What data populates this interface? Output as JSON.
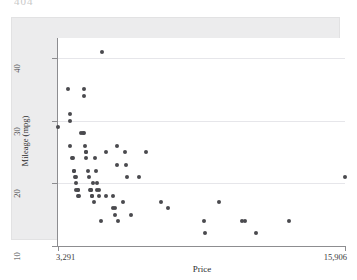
{
  "page": {
    "fragment_text": "404"
  },
  "chart_data": {
    "type": "scatter",
    "title": "",
    "xlabel": "Price",
    "ylabel": "Mileage (mpg)",
    "xlim": [
      3291,
      15906
    ],
    "ylim": [
      10,
      42
    ],
    "x_tick_labels": [
      "3,291",
      "15,906"
    ],
    "x_tick_values": [
      3291,
      15906
    ],
    "y_tick_labels": [
      "10",
      "20",
      "30",
      "40"
    ],
    "y_tick_values": [
      10,
      20,
      30,
      40
    ],
    "grid": true,
    "grid_axis": "y",
    "legend": null,
    "marker_color": "#4a4a4e",
    "marker_shape": "circle",
    "background_color": "#ececed",
    "plot_background_color": "#ffffff",
    "points": [
      {
        "x": 3291,
        "y": 29
      },
      {
        "x": 3748,
        "y": 35
      },
      {
        "x": 3798,
        "y": 31
      },
      {
        "x": 3799,
        "y": 30
      },
      {
        "x": 3829,
        "y": 26
      },
      {
        "x": 3895,
        "y": 24
      },
      {
        "x": 3955,
        "y": 24
      },
      {
        "x": 3984,
        "y": 22
      },
      {
        "x": 4010,
        "y": 22
      },
      {
        "x": 4060,
        "y": 21
      },
      {
        "x": 4082,
        "y": 21
      },
      {
        "x": 4099,
        "y": 20
      },
      {
        "x": 4100,
        "y": 19
      },
      {
        "x": 4172,
        "y": 19
      },
      {
        "x": 4181,
        "y": 19
      },
      {
        "x": 4187,
        "y": 18
      },
      {
        "x": 4195,
        "y": 18
      },
      {
        "x": 4296,
        "y": 28
      },
      {
        "x": 4389,
        "y": 28
      },
      {
        "x": 4424,
        "y": 28
      },
      {
        "x": 4425,
        "y": 34
      },
      {
        "x": 4453,
        "y": 35
      },
      {
        "x": 4482,
        "y": 26
      },
      {
        "x": 4504,
        "y": 25
      },
      {
        "x": 4516,
        "y": 25
      },
      {
        "x": 4535,
        "y": 24
      },
      {
        "x": 4589,
        "y": 22
      },
      {
        "x": 4647,
        "y": 21
      },
      {
        "x": 4697,
        "y": 19
      },
      {
        "x": 4733,
        "y": 19
      },
      {
        "x": 4749,
        "y": 19
      },
      {
        "x": 4765,
        "y": 18
      },
      {
        "x": 4782,
        "y": 18
      },
      {
        "x": 4816,
        "y": 20
      },
      {
        "x": 4890,
        "y": 17
      },
      {
        "x": 4934,
        "y": 24
      },
      {
        "x": 4941,
        "y": 22
      },
      {
        "x": 4995,
        "y": 20
      },
      {
        "x": 5005,
        "y": 19
      },
      {
        "x": 5079,
        "y": 19
      },
      {
        "x": 5104,
        "y": 18
      },
      {
        "x": 5189,
        "y": 14
      },
      {
        "x": 5222,
        "y": 41
      },
      {
        "x": 5379,
        "y": 25
      },
      {
        "x": 5397,
        "y": 18
      },
      {
        "x": 5705,
        "y": 18
      },
      {
        "x": 5719,
        "y": 16
      },
      {
        "x": 5788,
        "y": 16
      },
      {
        "x": 5799,
        "y": 15
      },
      {
        "x": 5886,
        "y": 26
      },
      {
        "x": 5899,
        "y": 23
      },
      {
        "x": 5922,
        "y": 14
      },
      {
        "x": 6165,
        "y": 17
      },
      {
        "x": 6229,
        "y": 25
      },
      {
        "x": 6295,
        "y": 23
      },
      {
        "x": 6342,
        "y": 21
      },
      {
        "x": 6486,
        "y": 15
      },
      {
        "x": 6850,
        "y": 21
      },
      {
        "x": 7140,
        "y": 25
      },
      {
        "x": 7827,
        "y": 17
      },
      {
        "x": 8129,
        "y": 16
      },
      {
        "x": 9690,
        "y": 14
      },
      {
        "x": 9735,
        "y": 12
      },
      {
        "x": 10372,
        "y": 17
      },
      {
        "x": 11385,
        "y": 14
      },
      {
        "x": 11497,
        "y": 14
      },
      {
        "x": 11995,
        "y": 12
      },
      {
        "x": 13466,
        "y": 14
      },
      {
        "x": 15906,
        "y": 21
      }
    ]
  }
}
